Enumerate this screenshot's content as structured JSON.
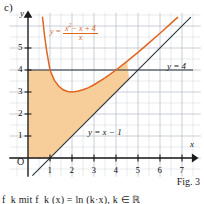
{
  "figure": {
    "part_label": "c)",
    "caption": "Fig. 3",
    "bottom_text": "f_k mit f_k (x) = ln (k·x),  k ∈ ℝ"
  },
  "colors": {
    "curve": "#e0651f",
    "shading": "#f7ce9a",
    "axis": "#1a1a1a",
    "grid": "#b9bfc9",
    "line": "#26303a"
  },
  "chart_data": {
    "type": "line",
    "title": "",
    "xlabel": "x",
    "ylabel": "y",
    "xlim": [
      -0.6,
      7.8
    ],
    "ylim": [
      -0.6,
      6.4
    ],
    "grid": true,
    "grid_minor_step": 0.5,
    "grid_major_step": 1,
    "origin_label": "O",
    "xticks": [
      1,
      2,
      3,
      4,
      5,
      6,
      7
    ],
    "yticks": [
      1,
      2,
      3,
      4,
      5
    ],
    "legend_position": "inline-annotations",
    "annotations": [
      {
        "name": "curve-equation",
        "text": "y = (x² − x + 4) / x",
        "numerator": "x² − x + 4",
        "denominator": "x",
        "lhs": "y =",
        "color": "#e0651f"
      },
      {
        "name": "horizontal-line-label",
        "text": "y = 4"
      },
      {
        "name": "asymptote-label",
        "text": "y = x − 1"
      }
    ],
    "series": [
      {
        "name": "y = (x^2 - x + 4)/x",
        "color": "#e0651f",
        "type": "curve",
        "minimum": {
          "x": 2,
          "y": 3
        },
        "points": [
          [
            0.66,
            6.4
          ],
          [
            0.75,
            5.58
          ],
          [
            0.85,
            4.86
          ],
          [
            1.0,
            4.0
          ],
          [
            1.2,
            3.53
          ],
          [
            1.4,
            3.26
          ],
          [
            1.6,
            3.1
          ],
          [
            1.8,
            3.02
          ],
          [
            2.0,
            3.0
          ],
          [
            2.25,
            3.03
          ],
          [
            2.5,
            3.1
          ],
          [
            2.75,
            3.2
          ],
          [
            3.0,
            3.33
          ],
          [
            3.5,
            3.64
          ],
          [
            4.0,
            4.0
          ],
          [
            4.5,
            4.39
          ],
          [
            5.0,
            4.8
          ],
          [
            5.5,
            5.23
          ],
          [
            6.0,
            5.67
          ],
          [
            6.5,
            6.12
          ],
          [
            6.8,
            6.39
          ]
        ]
      },
      {
        "name": "y = x - 1",
        "color": "#26303a",
        "type": "line",
        "slope": 1,
        "intercept": -1,
        "points": [
          [
            0.2,
            -0.8
          ],
          [
            7.4,
            6.4
          ]
        ]
      },
      {
        "name": "y = 4",
        "color": "#26303a",
        "type": "line",
        "slope": 0,
        "intercept": 4,
        "points": [
          [
            0,
            4
          ],
          [
            7.6,
            4
          ]
        ]
      }
    ],
    "shaded_region": {
      "name": "enclosed-area",
      "fill": "#f7ce9a",
      "description": "Region bounded above by y = 4, below by y = x - 1, on the left by the y-axis and x-axis, and above-right by the curve y = (x^2 - x + 4)/x",
      "x_range": [
        0,
        4.6
      ]
    }
  }
}
